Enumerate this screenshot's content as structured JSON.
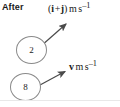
{
  "figure": {
    "phase_label": "After",
    "width": 120,
    "height": 107,
    "background_color": "#ffffff",
    "stroke_color": "#555555",
    "circle_stroke_color": "#8a8a8a",
    "text_color": "#1a1a1a"
  },
  "masses": [
    {
      "id": "mass-2",
      "label": "2",
      "cx": 31.5,
      "cy": 50,
      "rx": 15.5,
      "ry": 14
    },
    {
      "id": "mass-8",
      "label": "8",
      "cx": 25.5,
      "cy": 87,
      "rx": 15.5,
      "ry": 14
    }
  ],
  "vectors": [
    {
      "id": "velocity-vector-1",
      "from_mass": "2",
      "x1": 41,
      "y1": 46,
      "x2": 69,
      "y2": 22,
      "label": {
        "open_paren": "(",
        "i_symbol": "i",
        "operator": "+",
        "j_symbol": "j",
        "close_paren": ")",
        "unit_m": "m",
        "unit_s": "s",
        "exponent": "–1",
        "full_text": "(i + j) m s⁻¹"
      }
    },
    {
      "id": "velocity-vector-2",
      "from_mass": "8",
      "x1": 40,
      "y1": 85,
      "x2": 68,
      "y2": 70,
      "label": {
        "v_symbol": "v",
        "unit_m": "m",
        "unit_s": "s",
        "exponent": "–1",
        "full_text": "v m s⁻¹"
      }
    }
  ]
}
